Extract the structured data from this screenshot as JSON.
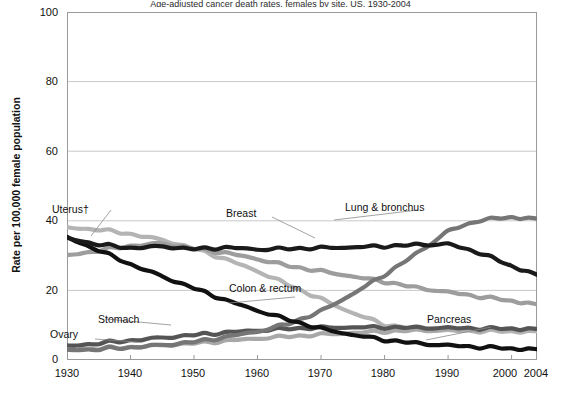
{
  "figure": {
    "title_partial": "Age-adjusted cancer death rates, females by site, US, 1930-2004",
    "ylabel": "Rate per 100,000 female population",
    "xlabel": ""
  },
  "axes": {
    "y_ticks": [
      "0",
      "20",
      "40",
      "60",
      "80",
      "100"
    ],
    "x_ticks": [
      "1930",
      "1940",
      "1950",
      "1960",
      "1970",
      "1980",
      "1990",
      "2000",
      "2004"
    ]
  },
  "series_labels": {
    "uterus": "Uterus†",
    "breast": "Breast",
    "lung": "Lung & bronchus",
    "colon": "Colon & rectum",
    "pancreas": "Pancreas",
    "stomach": "Stomach",
    "ovary": "Ovary"
  },
  "colors": {
    "uterus": "#b4b4b4",
    "breast": "#1a1a1a",
    "lung": "#767676",
    "colon": "#9d9d9d",
    "pancreas": "#a8a8a8",
    "stomach": "#111111",
    "ovary": "#555555",
    "grid": "#c9c9c9",
    "frame": "#9a9a9a",
    "leader": "#8a8a8a"
  },
  "chart_data": {
    "type": "line",
    "title": "Age-adjusted cancer death rates, females by site, US, 1930-2004",
    "xlabel": "",
    "ylabel": "Rate per 100,000 female population",
    "xlim": [
      1930,
      2004
    ],
    "ylim": [
      0,
      100
    ],
    "yticks": [
      0,
      20,
      40,
      60,
      80,
      100
    ],
    "xticks": [
      1930,
      1940,
      1950,
      1960,
      1970,
      1980,
      1990,
      2000,
      2004
    ],
    "grid": "horizontal",
    "legend": "inline-annotations",
    "x": [
      1930,
      1935,
      1940,
      1945,
      1950,
      1955,
      1960,
      1965,
      1970,
      1975,
      1980,
      1985,
      1990,
      1995,
      2000,
      2004
    ],
    "series": [
      {
        "name": "Uterus†",
        "color": "#b4b4b4",
        "values": [
          38.0,
          37.5,
          36.2,
          34.5,
          32.0,
          29.0,
          25.5,
          21.5,
          17.5,
          13.5,
          10.2,
          8.8,
          8.4,
          8.3,
          8.2,
          8.2
        ]
      },
      {
        "name": "Breast",
        "color": "#1a1a1a",
        "values": [
          35.0,
          33.2,
          32.2,
          32.6,
          31.9,
          32.3,
          31.8,
          32.0,
          32.2,
          32.4,
          32.7,
          33.1,
          33.3,
          30.8,
          27.0,
          24.5
        ]
      },
      {
        "name": "Lung & bronchus",
        "color": "#767676",
        "values": [
          2.8,
          3.1,
          3.6,
          4.3,
          5.2,
          6.6,
          8.2,
          10.5,
          14.0,
          19.0,
          24.5,
          30.5,
          37.0,
          40.2,
          41.0,
          40.6
        ]
      },
      {
        "name": "Colon & rectum",
        "color": "#9d9d9d",
        "values": [
          30.0,
          31.5,
          32.8,
          33.5,
          32.0,
          30.8,
          29.0,
          27.0,
          25.5,
          24.0,
          22.5,
          20.8,
          19.5,
          18.2,
          17.0,
          16.0
        ]
      },
      {
        "name": "Pancreas",
        "color": "#a8a8a8",
        "values": [
          3.0,
          3.3,
          3.7,
          4.2,
          4.8,
          5.5,
          6.2,
          6.8,
          7.3,
          7.8,
          8.2,
          8.5,
          8.7,
          8.8,
          8.9,
          8.9
        ]
      },
      {
        "name": "Stomach",
        "color": "#111111",
        "values": [
          35.2,
          31.5,
          27.5,
          24.0,
          20.6,
          17.2,
          14.2,
          11.5,
          9.0,
          7.2,
          5.8,
          4.8,
          4.2,
          3.7,
          3.3,
          3.1
        ]
      },
      {
        "name": "Ovary",
        "color": "#555555",
        "values": [
          4.0,
          4.8,
          5.6,
          6.4,
          7.2,
          7.9,
          8.5,
          9.0,
          9.3,
          9.4,
          9.4,
          9.3,
          9.2,
          9.1,
          9.0,
          8.9
        ]
      }
    ]
  }
}
